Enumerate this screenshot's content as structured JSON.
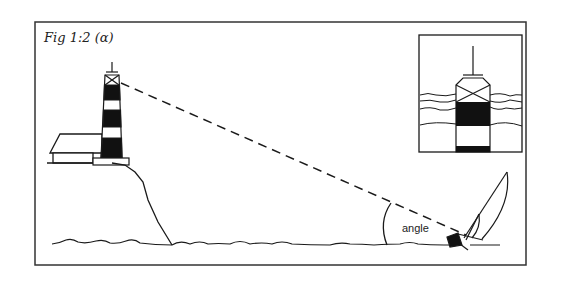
{
  "figure": {
    "caption": "Fig 1:2 (α)",
    "angle_label": "angle",
    "elements": [
      "lighthouse",
      "house",
      "cliff",
      "sea",
      "sight-line",
      "sailboat",
      "inset-view"
    ]
  },
  "colors": {
    "ink": "#1a1a1a",
    "paper": "#ffffff"
  }
}
